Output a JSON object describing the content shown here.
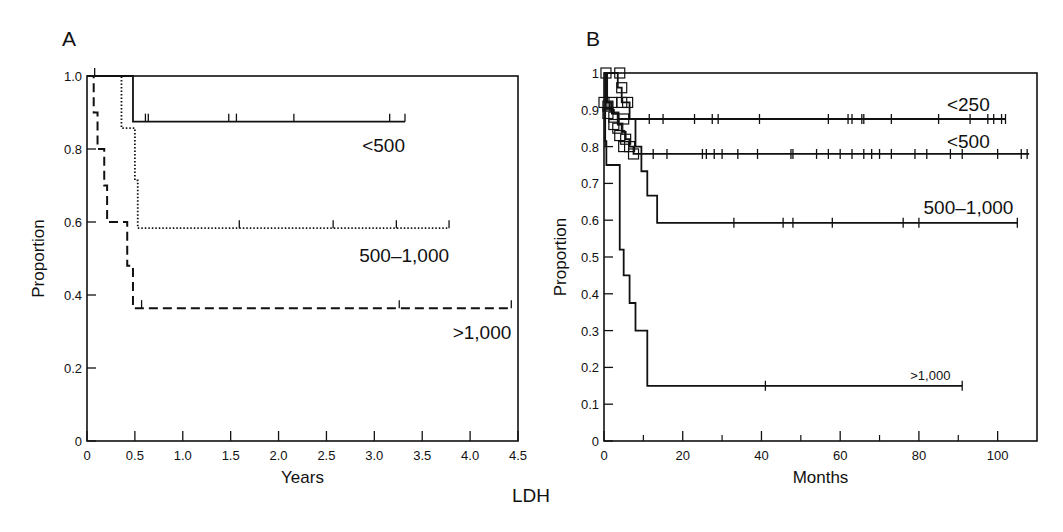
{
  "figure": {
    "shared_label": "LDH"
  },
  "chart_data": [
    {
      "panel": "A",
      "type": "line",
      "subtype": "kaplan-meier step",
      "title": "",
      "xlabel": "Years",
      "ylabel": "Proportion",
      "xlim": [
        0,
        4.5
      ],
      "ylim": [
        0,
        1.0
      ],
      "xticks": [
        0,
        0.5,
        1.0,
        1.5,
        2.0,
        2.5,
        3.0,
        3.5,
        4.0,
        4.5
      ],
      "xtick_labels": [
        "0",
        "0.5",
        "1.0",
        "1.5",
        "2.0",
        "2.5",
        "3.0",
        "3.5",
        "4.0",
        "4.5"
      ],
      "yticks": [
        0,
        0.2,
        0.4,
        0.6,
        0.8,
        1.0
      ],
      "ytick_labels": [
        "0",
        "0.2",
        "0.4",
        "0.6",
        "0.8",
        "1.0"
      ],
      "grid": false,
      "legend": "inline labels",
      "series": [
        {
          "name": "<500",
          "style": "solid",
          "steps": [
            [
              0,
              1.0
            ],
            [
              0.48,
              0.875
            ]
          ],
          "end": 3.32,
          "censored": [
            0.08,
            0.61,
            0.64,
            1.48,
            1.56,
            2.16,
            3.16,
            3.32
          ],
          "label_pos": [
            3.32,
            0.81
          ]
        },
        {
          "name": "500–1,000",
          "style": "dotted",
          "steps": [
            [
              0,
              1.0
            ],
            [
              0.36,
              0.857
            ],
            [
              0.5,
              0.714
            ],
            [
              0.53,
              0.583
            ]
          ],
          "end": 3.78,
          "censored": [
            1.59,
            2.57,
            3.23,
            3.78
          ],
          "label_pos": [
            3.78,
            0.51
          ]
        },
        {
          "name": ">1,000",
          "style": "dashed",
          "steps": [
            [
              0,
              1.0
            ],
            [
              0.07,
              0.9
            ],
            [
              0.11,
              0.8
            ],
            [
              0.18,
              0.7
            ],
            [
              0.21,
              0.6
            ],
            [
              0.42,
              0.48
            ],
            [
              0.48,
              0.364
            ]
          ],
          "end": 4.43,
          "censored": [
            0.57,
            3.26,
            4.43
          ],
          "label_pos": [
            4.43,
            0.3
          ]
        }
      ]
    },
    {
      "panel": "B",
      "type": "line",
      "subtype": "kaplan-meier step",
      "title": "",
      "xlabel": "Months",
      "ylabel": "Proportion",
      "xlim": [
        0,
        110
      ],
      "ylim": [
        0,
        1.0
      ],
      "xticks": [
        0,
        20,
        40,
        60,
        80,
        100
      ],
      "xtick_labels": [
        "0",
        "20",
        "40",
        "60",
        "80",
        "100"
      ],
      "xminor": [
        10,
        30,
        50,
        70,
        90
      ],
      "yticks": [
        0,
        0.1,
        0.2,
        0.3,
        0.4,
        0.5,
        0.6,
        0.7,
        0.8,
        0.9,
        1.0
      ],
      "ytick_labels": [
        "0",
        "0.1",
        "0.2",
        "0.3",
        "0.4",
        "0.5",
        "0.6",
        "0.7",
        "0.8",
        "0.9",
        "1"
      ],
      "grid": false,
      "legend": "inline labels",
      "series": [
        {
          "name": "<250",
          "style": "solid",
          "steps": [
            [
              0,
              1.0
            ],
            [
              0.8,
              0.92
            ],
            [
              1.5,
              0.9
            ],
            [
              2.5,
              0.89
            ],
            [
              3.5,
              0.875
            ]
          ],
          "end": 102,
          "censored": [
            11.5,
            15,
            23,
            27.5,
            29,
            39.5,
            57,
            62,
            63,
            65.5,
            66,
            73,
            85,
            93,
            97.5,
            99,
            101,
            102
          ],
          "label_pos": [
            98,
            0.915
          ]
        },
        {
          "name": "<500",
          "style": "solid",
          "steps": [
            [
              0,
              1.0
            ],
            [
              0.5,
              0.92
            ],
            [
              2,
              0.89
            ],
            [
              3.5,
              0.86
            ],
            [
              4.5,
              0.84
            ],
            [
              5.5,
              0.82
            ],
            [
              6.5,
              0.8
            ],
            [
              7.5,
              0.78
            ]
          ],
          "end": 108,
          "censored": [
            12.5,
            16,
            25,
            26,
            28,
            30,
            34,
            39,
            47.5,
            48,
            54,
            57,
            60,
            63,
            66,
            68,
            70,
            73,
            79,
            82,
            88,
            91,
            100,
            106,
            107.5
          ],
          "label_pos": [
            98,
            0.815
          ]
        },
        {
          "name": "500–1,000",
          "style": "solid",
          "steps": [
            [
              0,
              1.0
            ],
            [
              3.5,
              0.96
            ],
            [
              4.5,
              0.92
            ],
            [
              6.5,
              0.875
            ],
            [
              8,
              0.8
            ],
            [
              9.5,
              0.733
            ],
            [
              11,
              0.667
            ],
            [
              13.5,
              0.593
            ]
          ],
          "end": 105,
          "censored": [
            33,
            45.5,
            48,
            58,
            76,
            80,
            105
          ],
          "label_pos": [
            104,
            0.635
          ]
        },
        {
          "name": ">1,000",
          "style": "solid",
          "steps": [
            [
              0,
              1.0
            ],
            [
              0.3,
              0.815
            ],
            [
              0.6,
              0.75
            ],
            [
              4,
              0.52
            ],
            [
              5,
              0.45
            ],
            [
              6.5,
              0.375
            ],
            [
              8,
              0.3
            ],
            [
              11,
              0.15
            ]
          ],
          "end": 91,
          "censored": [
            0.3,
            41,
            91
          ],
          "label_pos": [
            88,
            0.185
          ]
        }
      ]
    }
  ]
}
